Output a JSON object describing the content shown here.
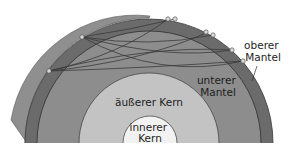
{
  "diagram": {
    "type": "earth-cross-section",
    "layers": [
      {
        "id": "oberer-mantel",
        "label_line1": "oberer",
        "label_line2": "Mantel",
        "color": "#6b6b6b"
      },
      {
        "id": "unterer-mantel",
        "label_line1": "unterer",
        "label_line2": "Mantel",
        "color": "#8d8d8d"
      },
      {
        "id": "aeusserer-kern",
        "label": "äußerer Kern",
        "color": "#c3c3c3"
      },
      {
        "id": "innerer-kern",
        "label_line1": "innerer",
        "label_line2": "Kern",
        "color": "#f2f2f2"
      }
    ],
    "surface_face_color": "#8f8f8f",
    "ray_color": "#3a3a3a",
    "station_color": "#d8d8d8"
  }
}
